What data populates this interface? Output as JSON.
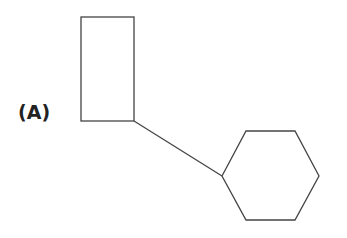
{
  "figure": {
    "label": "(A)",
    "stroke_color": "#444444",
    "background": "#ffffff"
  },
  "shapes": [
    {
      "type": "rectangle",
      "name": "rectangle"
    },
    {
      "type": "connector-line",
      "name": "bond"
    },
    {
      "type": "hexagon",
      "name": "hexagon"
    }
  ]
}
